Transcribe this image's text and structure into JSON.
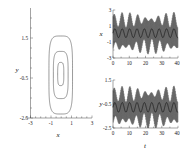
{
  "figure": {
    "background": "#ffffff",
    "line_color": "#222222",
    "panels": [
      "phase-portrait",
      "x-vs-t",
      "y-vs-t"
    ]
  },
  "chart_data": [
    {
      "type": "line",
      "name": "phase-portrait",
      "title": "",
      "xlabel": "x",
      "ylabel": "y",
      "xlim": [
        -3,
        3
      ],
      "ylim": [
        -2.5,
        2.5
      ],
      "xticks": [
        -3,
        -1,
        1,
        3
      ],
      "xtick_labels": [
        "-3",
        "-1",
        "1",
        "3"
      ],
      "yticks": [
        -2.5,
        -0.5,
        1.5
      ],
      "ytick_labels": [
        "-2.5",
        "-0.5",
        "1.5"
      ],
      "grid": false,
      "legend": "none",
      "series": [
        {
          "name": "outer-orbit",
          "description": "outermost closed superelliptic orbit",
          "x_radius": 1.15,
          "y_radius": 1.95,
          "center": [
            -0.05,
            -0.35
          ],
          "exponent": 4.2
        },
        {
          "name": "middle-orbit",
          "description": "middle closed superelliptic orbit",
          "x_radius": 0.72,
          "y_radius": 1.18,
          "center": [
            -0.05,
            -0.35
          ],
          "exponent": 3.8
        },
        {
          "name": "inner-orbit",
          "description": "innermost closed superelliptic orbit",
          "x_radius": 0.3,
          "y_radius": 0.58,
          "center": [
            -0.05,
            -0.3
          ],
          "exponent": 3.4
        }
      ]
    },
    {
      "type": "line",
      "name": "x-vs-t",
      "title": "",
      "xlabel": "t",
      "ylabel": "x",
      "xlim": [
        0,
        40
      ],
      "ylim": [
        -3,
        3
      ],
      "xticks": [
        0,
        10,
        20,
        30,
        40
      ],
      "xtick_labels": [
        "0",
        "10",
        "20",
        "30",
        "40"
      ],
      "yticks": [
        -3,
        -1,
        1,
        3
      ],
      "ytick_labels": [
        "-3",
        "-1",
        "1",
        "3"
      ],
      "grid": false,
      "legend": "none",
      "series": [
        {
          "name": "fast-oscillation",
          "description": "high frequency oscillation filling band",
          "frequency": 3.6,
          "amplitude": 2.1,
          "offset": 0.1
        },
        {
          "name": "slow-envelope",
          "description": "slow modulation mean curve",
          "frequency": 0.22,
          "amplitude": 0.55,
          "offset": 0.1
        }
      ]
    },
    {
      "type": "line",
      "name": "y-vs-t",
      "title": "",
      "xlabel": "t",
      "ylabel": "y",
      "xlim": [
        0,
        40
      ],
      "ylim": [
        -2.5,
        2.5
      ],
      "xticks": [
        0,
        10,
        20,
        30,
        40
      ],
      "xtick_labels": [
        "0",
        "10",
        "20",
        "30",
        "40"
      ],
      "yticks": [
        -2.5,
        -0.5,
        1.5
      ],
      "ytick_labels": [
        "-2.5",
        "-0.5",
        "1.5"
      ],
      "grid": false,
      "legend": "none",
      "series": [
        {
          "name": "fast-oscillation",
          "description": "high frequency oscillation filling band",
          "frequency": 3.6,
          "amplitude": 1.75,
          "offset": -0.35
        },
        {
          "name": "slow-envelope",
          "description": "slow modulation mean curve",
          "frequency": 0.22,
          "amplitude": 0.5,
          "offset": -0.35
        }
      ]
    }
  ]
}
